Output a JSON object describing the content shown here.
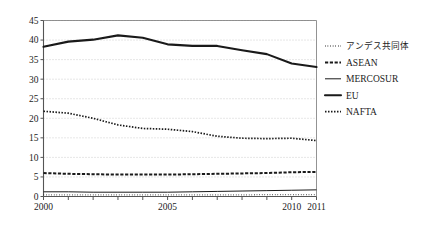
{
  "chart_data": {
    "type": "line",
    "title": "",
    "xlabel": "",
    "ylabel": "",
    "x": [
      2000,
      2001,
      2002,
      2003,
      2004,
      2005,
      2006,
      2007,
      2008,
      2009,
      2010,
      2011
    ],
    "xlim": [
      2000,
      2011
    ],
    "ylim": [
      0,
      45
    ],
    "yticks": [
      0,
      5,
      10,
      15,
      20,
      25,
      30,
      35,
      40,
      45
    ],
    "xticks": [
      2000,
      2001,
      2002,
      2003,
      2004,
      2005,
      2006,
      2007,
      2008,
      2009,
      2010,
      2011
    ],
    "xtick_labels_visible": [
      "2000",
      "2005",
      "2010",
      "2011"
    ],
    "grid": "horizontal-dotted",
    "legend_position": "right",
    "series": [
      {
        "name": "アンデス共同体",
        "style": "fine-dotted",
        "values": [
          0.4,
          0.4,
          0.4,
          0.4,
          0.4,
          0.4,
          0.4,
          0.4,
          0.4,
          0.5,
          0.5,
          0.5
        ]
      },
      {
        "name": "ASEAN",
        "style": "thick-dashed",
        "values": [
          6.0,
          5.8,
          5.7,
          5.6,
          5.6,
          5.6,
          5.7,
          5.8,
          5.9,
          6.0,
          6.2,
          6.3
        ]
      },
      {
        "name": "MERCOSUR",
        "style": "thin-solid",
        "values": [
          1.2,
          1.2,
          1.1,
          1.1,
          1.1,
          1.1,
          1.2,
          1.3,
          1.4,
          1.5,
          1.6,
          1.7
        ]
      },
      {
        "name": "EU",
        "style": "thick-solid",
        "values": [
          38.3,
          39.6,
          40.1,
          41.2,
          40.6,
          38.9,
          38.5,
          38.5,
          37.4,
          36.4,
          34.0,
          33.1
        ]
      },
      {
        "name": "NAFTA",
        "style": "dotted",
        "values": [
          21.8,
          21.3,
          20.0,
          18.3,
          17.4,
          17.2,
          16.6,
          15.4,
          14.9,
          14.8,
          14.9,
          14.3
        ]
      }
    ]
  },
  "axes": {
    "y_tick_labels": [
      "0",
      "5",
      "10",
      "15",
      "20",
      "25",
      "30",
      "35",
      "40",
      "45"
    ],
    "x_tick_labels": [
      "2000",
      "2005",
      "2010",
      "2011"
    ]
  },
  "legend": {
    "items": [
      {
        "label": "アンデス共同体",
        "marker": "fine-dotted-line-icon"
      },
      {
        "label": "ASEAN",
        "marker": "thick-dashed-line-icon"
      },
      {
        "label": "MERCOSUR",
        "marker": "thin-solid-line-icon"
      },
      {
        "label": "EU",
        "marker": "thick-solid-line-icon"
      },
      {
        "label": "NAFTA",
        "marker": "dotted-line-icon"
      }
    ]
  },
  "colors": {
    "line": "#1a1a1a",
    "grid": "#b8b8b8",
    "axis": "#4a4a4a",
    "background": "#ffffff"
  }
}
